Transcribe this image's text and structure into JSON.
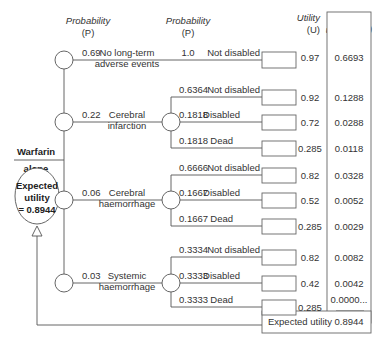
{
  "headers": {
    "prob1": "Probability",
    "prob1_sub": "(P)",
    "prob2": "Probability",
    "prob2_sub": "(P)",
    "utility": "Utility",
    "utility_sub": "(U)",
    "weighted": "Weighted",
    "weighted_sub": "utility (WU)"
  },
  "decision": {
    "label_line1": "Warfarin",
    "label_line2": "alone"
  },
  "expected_node": {
    "line1": "Expected",
    "line2": "utility",
    "line3": "= 0.8944"
  },
  "branches": [
    {
      "prob": "0.69",
      "label_line1": "No long-term",
      "label_line2": "adverse events",
      "outcomes": [
        {
          "prob": "1.0",
          "label": "Not disabled",
          "utility": "0.97",
          "weighted": "0.6693"
        }
      ]
    },
    {
      "prob": "0.22",
      "label_line1": "Cerebral",
      "label_line2": "infarction",
      "outcomes": [
        {
          "prob": "0.6364",
          "label": "Not disabled",
          "utility": "0.92",
          "weighted": "0.1288"
        },
        {
          "prob": "0.1818",
          "label": "Disabled",
          "utility": "0.72",
          "weighted": "0.0288"
        },
        {
          "prob": "0.1818",
          "label": "Dead",
          "utility": "0.285",
          "weighted": "0.0118"
        }
      ]
    },
    {
      "prob": "0.06",
      "label_line1": "Cerebral",
      "label_line2": "haemorrhage",
      "outcomes": [
        {
          "prob": "0.6666",
          "label": "Not disabled",
          "utility": "0.82",
          "weighted": "0.0328"
        },
        {
          "prob": "0.1667",
          "label": "Disabled",
          "utility": "0.52",
          "weighted": "0.0052"
        },
        {
          "prob": "0.1667",
          "label": "Dead",
          "utility": "0.285",
          "weighted": "0.0029"
        }
      ]
    },
    {
      "prob": "0.03",
      "label_line1": "Systemic",
      "label_line2": "haemorrhage",
      "outcomes": [
        {
          "prob": "0.3334",
          "label": "Not disabled",
          "utility": "0.82",
          "weighted": "0.0082"
        },
        {
          "prob": "0.3333",
          "label": "Disabled",
          "utility": "0.42",
          "weighted": "0.0042"
        },
        {
          "prob": "0.3333",
          "label": "Dead",
          "utility": "0.285",
          "weighted": "0.0000..."
        }
      ]
    }
  ],
  "total": {
    "label": "Expected utility",
    "value": "0.8944"
  }
}
